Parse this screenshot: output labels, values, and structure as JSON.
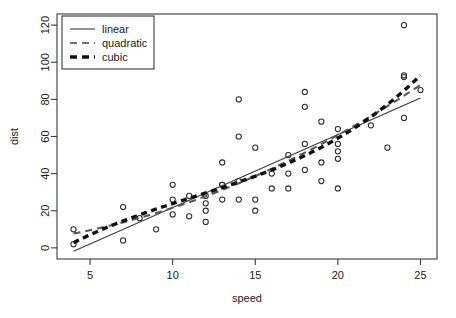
{
  "chart_data": {
    "type": "scatter",
    "title": "",
    "xlabel": "speed",
    "ylabel": "dist",
    "xlim": [
      3.0,
      26.0
    ],
    "ylim": [
      -6,
      126
    ],
    "xticks": [
      5,
      10,
      15,
      20,
      25
    ],
    "yticks": [
      0,
      20,
      40,
      60,
      80,
      100,
      120
    ],
    "grid": false,
    "point_marker": "open-circle",
    "legend_position": "top-left",
    "legend": [
      "linear",
      "quadratic",
      "cubic"
    ],
    "x": [
      4,
      4,
      7,
      7,
      8,
      9,
      10,
      10,
      10,
      11,
      11,
      12,
      12,
      12,
      12,
      13,
      13,
      13,
      13,
      14,
      14,
      14,
      14,
      15,
      15,
      15,
      16,
      16,
      17,
      17,
      17,
      18,
      18,
      18,
      18,
      19,
      19,
      19,
      20,
      20,
      20,
      20,
      20,
      22,
      23,
      24,
      24,
      24,
      24,
      25
    ],
    "y": [
      2,
      10,
      4,
      22,
      16,
      10,
      18,
      26,
      34,
      17,
      28,
      14,
      20,
      24,
      28,
      26,
      34,
      34,
      46,
      26,
      36,
      60,
      80,
      20,
      26,
      54,
      32,
      40,
      32,
      40,
      50,
      42,
      56,
      76,
      84,
      36,
      46,
      68,
      32,
      48,
      52,
      56,
      64,
      66,
      54,
      70,
      92,
      93,
      120,
      85
    ],
    "series": [
      {
        "name": "linear",
        "style": "solid",
        "coefficients": [
          -17.5791,
          3.9324
        ],
        "degree": 1
      },
      {
        "name": "quadratic",
        "style": "dashed",
        "coefficients": [
          2.47014,
          0.91329,
          0.09996
        ],
        "degree": 2
      },
      {
        "name": "cubic",
        "style": "thick-dashed",
        "coefficients": [
          -19.50505,
          6.80111,
          -0.34966,
          0.010303
        ],
        "degree": 3
      }
    ]
  },
  "axes": {
    "x_label": "speed",
    "y_label": "dist",
    "x_tick_labels": [
      "5",
      "10",
      "15",
      "20",
      "25"
    ],
    "y_tick_labels": [
      "0",
      "20",
      "40",
      "60",
      "80",
      "100",
      "120"
    ]
  },
  "legend": {
    "entries": [
      {
        "label": "linear"
      },
      {
        "label": "quadratic"
      },
      {
        "label": "cubic"
      }
    ]
  }
}
